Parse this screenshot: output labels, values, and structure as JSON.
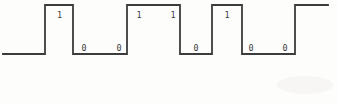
{
  "figure": {
    "type": "digital-waveform",
    "bit_sequence": [
      "1",
      "0",
      "0",
      "1",
      "1",
      "0",
      "1",
      "0",
      "0"
    ],
    "line_color": "#3c3c3c",
    "label_color": "#3c3c3c",
    "background_color": "#fdfdfc",
    "artifact_color": "#f2f1ee",
    "waveform": {
      "initial_level": "low",
      "high_y": 5,
      "low_y": 54,
      "start_x": 3,
      "end_x": 328,
      "edges": [
        45,
        73,
        127,
        180,
        212,
        242,
        295
      ],
      "stroke_width": 1.8
    },
    "labels": [
      {
        "text": "1",
        "x": 59.5,
        "y": 14.5,
        "level": "high"
      },
      {
        "text": "0",
        "x": 84,
        "y": 47.5,
        "level": "low"
      },
      {
        "text": "0",
        "x": 119,
        "y": 47.5,
        "level": "low"
      },
      {
        "text": "1",
        "x": 139,
        "y": 14.5,
        "level": "high"
      },
      {
        "text": "1",
        "x": 173,
        "y": 14.5,
        "level": "high"
      },
      {
        "text": "0",
        "x": 196,
        "y": 47.5,
        "level": "low"
      },
      {
        "text": "1",
        "x": 227,
        "y": 14.5,
        "level": "high"
      },
      {
        "text": "0",
        "x": 251,
        "y": 47.5,
        "level": "low"
      },
      {
        "text": "0",
        "x": 285,
        "y": 47.5,
        "level": "low"
      }
    ]
  }
}
